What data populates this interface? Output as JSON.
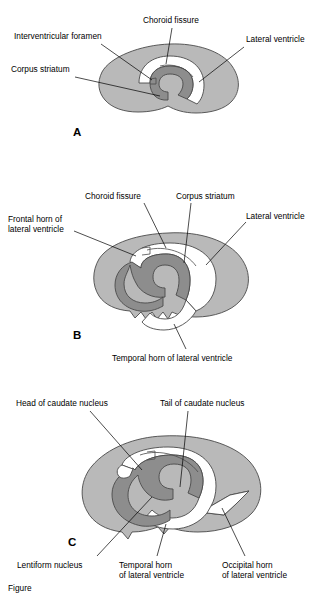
{
  "figure": {
    "caption_partial": "Figure",
    "panels": [
      {
        "id": "A",
        "letter": "A",
        "labels": [
          {
            "name": "interventricular-foramen",
            "text": "Interventricular foramen"
          },
          {
            "name": "choroid-fissure",
            "text": "Choroid fissure"
          },
          {
            "name": "lateral-ventricle",
            "text": "Lateral ventricle"
          },
          {
            "name": "corpus-striatum",
            "text": "Corpus striatum"
          }
        ]
      },
      {
        "id": "B",
        "letter": "B",
        "labels": [
          {
            "name": "choroid-fissure",
            "text": "Choroid fissure"
          },
          {
            "name": "corpus-striatum",
            "text": "Corpus striatum"
          },
          {
            "name": "frontal-horn-line1",
            "text": "Frontal horn of"
          },
          {
            "name": "frontal-horn-line2",
            "text": "lateral ventricle"
          },
          {
            "name": "lateral-ventricle",
            "text": "Lateral ventricle"
          },
          {
            "name": "temporal-horn",
            "text": "Temporal horn of lateral ventricle"
          }
        ]
      },
      {
        "id": "C",
        "letter": "C",
        "labels": [
          {
            "name": "head-of-caudate-nucleus",
            "text": "Head of caudate nucleus"
          },
          {
            "name": "tail-of-caudate-nucleus",
            "text": "Tail of caudate nucleus"
          },
          {
            "name": "lentiform-nucleus",
            "text": "Lentiform nucleus"
          },
          {
            "name": "temporal-horn-line1",
            "text": "Temporal horn"
          },
          {
            "name": "temporal-horn-line2",
            "text": "of lateral ventricle"
          },
          {
            "name": "occipital-horn-line1",
            "text": "Occipital horn"
          },
          {
            "name": "occipital-horn-line2",
            "text": "of lateral ventricle"
          }
        ]
      }
    ],
    "colors": {
      "brain_tissue": "#b9b9b9",
      "corpus_striatum": "#8d8d8d",
      "ventricle": "#ffffff",
      "outline": "#4a4a4a",
      "text": "#000000",
      "background": "#ffffff"
    }
  }
}
